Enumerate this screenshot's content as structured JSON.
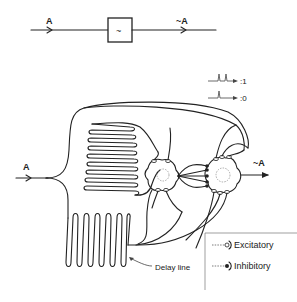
{
  "top_diagram": {
    "input_label": "A",
    "gate_symbol": "~",
    "output_label": "~A"
  },
  "neural_diagram": {
    "input_label": "A",
    "output_label": "~A",
    "delay_label": "Delay line"
  },
  "pulse_legend": {
    "two_pulses": ":1",
    "one_pulse": ":0"
  },
  "synapse_legend": {
    "excitatory": "Excitatory",
    "inhibitory": "Inhibitory"
  },
  "colors": {
    "line": "#222222",
    "background": "#ffffff",
    "soma_dash": "#888888"
  }
}
